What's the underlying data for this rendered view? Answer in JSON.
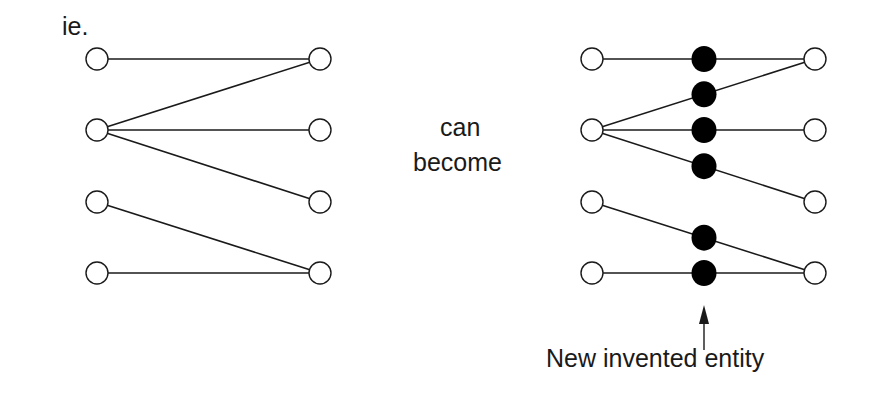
{
  "labels": {
    "prefix": "ie.",
    "middle_line1": "can",
    "middle_line2": "become",
    "annotation": "New invented entity"
  },
  "left_graph": {
    "left_nodes": [
      {
        "x": 97,
        "y": 59
      },
      {
        "x": 97,
        "y": 130
      },
      {
        "x": 97,
        "y": 202
      },
      {
        "x": 97,
        "y": 273
      }
    ],
    "right_nodes": [
      {
        "x": 320,
        "y": 59
      },
      {
        "x": 320,
        "y": 130
      },
      {
        "x": 320,
        "y": 202
      },
      {
        "x": 320,
        "y": 273
      }
    ],
    "edges": [
      [
        0,
        0
      ],
      [
        1,
        0
      ],
      [
        1,
        1
      ],
      [
        1,
        2
      ],
      [
        2,
        3
      ],
      [
        3,
        3
      ]
    ]
  },
  "right_graph": {
    "left_nodes": [
      {
        "x": 592,
        "y": 59
      },
      {
        "x": 592,
        "y": 130
      },
      {
        "x": 592,
        "y": 202
      },
      {
        "x": 592,
        "y": 273
      }
    ],
    "right_nodes": [
      {
        "x": 815,
        "y": 59
      },
      {
        "x": 815,
        "y": 130
      },
      {
        "x": 815,
        "y": 202
      },
      {
        "x": 815,
        "y": 273
      }
    ],
    "edges": [
      [
        0,
        0
      ],
      [
        1,
        0
      ],
      [
        1,
        1
      ],
      [
        1,
        2
      ],
      [
        2,
        3
      ],
      [
        3,
        3
      ]
    ],
    "invented_x": 704
  },
  "colors": {
    "line": "#1a1a1a",
    "node_fill": "#ffffff",
    "invented_fill": "#000000"
  }
}
